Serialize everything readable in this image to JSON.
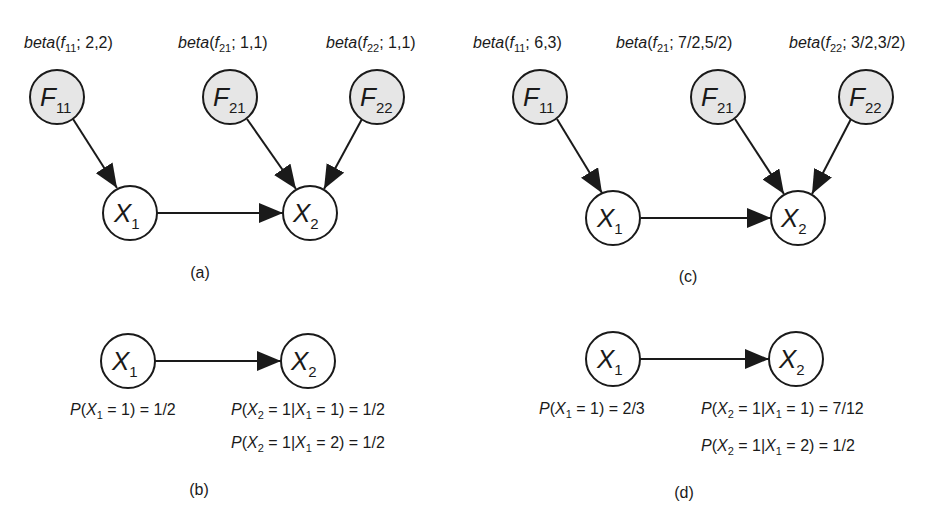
{
  "colors": {
    "shaded_node": "#e6e6e6",
    "plain_node": "#ffffff",
    "stroke": "#1a1a1a"
  },
  "panels": {
    "a": {
      "caption": "(a)",
      "priors": [
        {
          "fn": "beta",
          "var": "f",
          "sub": "11",
          "params": "; 2,2)"
        },
        {
          "fn": "beta",
          "var": "f",
          "sub": "21",
          "params": "; 1,1)"
        },
        {
          "fn": "beta",
          "var": "f",
          "sub": "22",
          "params": "; 1,1)"
        }
      ],
      "nodes": [
        {
          "id": "F11",
          "letter": "F",
          "sub": "11",
          "shaded": true
        },
        {
          "id": "F21",
          "letter": "F",
          "sub": "21",
          "shaded": true
        },
        {
          "id": "F22",
          "letter": "F",
          "sub": "22",
          "shaded": true
        },
        {
          "id": "X1",
          "letter": "X",
          "sub": "1",
          "shaded": false
        },
        {
          "id": "X2",
          "letter": "X",
          "sub": "2",
          "shaded": false
        }
      ]
    },
    "b": {
      "caption": "(b)",
      "nodes": [
        {
          "id": "X1",
          "letter": "X",
          "sub": "1"
        },
        {
          "id": "X2",
          "letter": "X",
          "sub": "2"
        }
      ],
      "probs": {
        "p1": {
          "value": "1/2"
        },
        "p2a": {
          "value": "1/2"
        },
        "p2b": {
          "value": "1/2"
        }
      }
    },
    "c": {
      "caption": "(c)",
      "priors": [
        {
          "fn": "beta",
          "var": "f",
          "sub": "11",
          "params": "; 6,3)"
        },
        {
          "fn": "beta",
          "var": "f",
          "sub": "21",
          "params": "; 7/2,5/2)"
        },
        {
          "fn": "beta",
          "var": "f",
          "sub": "22",
          "params": "; 3/2,3/2)"
        }
      ],
      "nodes": [
        {
          "id": "F11",
          "letter": "F",
          "sub": "11",
          "shaded": true
        },
        {
          "id": "F21",
          "letter": "F",
          "sub": "21",
          "shaded": true
        },
        {
          "id": "F22",
          "letter": "F",
          "sub": "22",
          "shaded": true
        },
        {
          "id": "X1",
          "letter": "X",
          "sub": "1",
          "shaded": false
        },
        {
          "id": "X2",
          "letter": "X",
          "sub": "2",
          "shaded": false
        }
      ]
    },
    "d": {
      "caption": "(d)",
      "nodes": [
        {
          "id": "X1",
          "letter": "X",
          "sub": "1"
        },
        {
          "id": "X2",
          "letter": "X",
          "sub": "2"
        }
      ],
      "probs": {
        "p1": {
          "value": "2/3"
        },
        "p2a": {
          "value": "7/12"
        },
        "p2b": {
          "value": "1/2"
        }
      }
    }
  },
  "text": {
    "open": "(",
    "P": "P",
    "X": "X",
    "eq1close": " = 1) = ",
    "eq1bar": " = 1|",
    "x1eq1": " = 1) = ",
    "x1eq2": " = 2) = ",
    "one": "1",
    "two": "2"
  }
}
